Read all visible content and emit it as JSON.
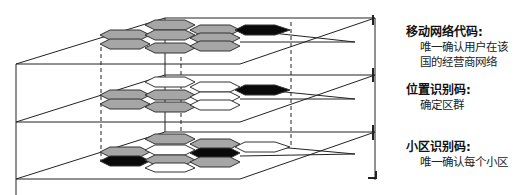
{
  "diagram": {
    "type": "layered-plane-hexagon-cell-diagram",
    "colors": {
      "line": "#222222",
      "cell_gray": "#a6a6a6",
      "cell_black": "#0a0a0a",
      "cell_white": "#ffffff"
    },
    "layers": [
      {
        "name": "mobile-network-layer",
        "cells_row_top": [
          "gray",
          "gray",
          "black"
        ],
        "cells_row_mid": [
          "gray",
          "gray",
          "gray"
        ],
        "cells_row_bot": [
          "gray",
          "gray",
          "gray"
        ]
      },
      {
        "name": "location-area-layer",
        "cells_row_top": [
          "white",
          "white",
          "black"
        ],
        "cells_row_mid": [
          "gray",
          "gray",
          "white"
        ],
        "cells_row_bot": [
          "gray",
          "gray",
          "white"
        ]
      },
      {
        "name": "cell-layer",
        "cells_row_top": [
          "gray",
          "gray",
          "white"
        ],
        "cells_row_mid": [
          "gray",
          "white",
          "black"
        ],
        "cells_row_bot": [
          "black",
          "gray",
          "gray"
        ]
      }
    ]
  },
  "labels": [
    {
      "title": "移动网络代码:",
      "lines": [
        "唯一确认用户在该",
        "国的经营商网络"
      ]
    },
    {
      "title": "位置识别码:",
      "lines": [
        "确定区群"
      ]
    },
    {
      "title": "小区识别码:",
      "lines": [
        "唯一确认每个小区"
      ]
    }
  ]
}
